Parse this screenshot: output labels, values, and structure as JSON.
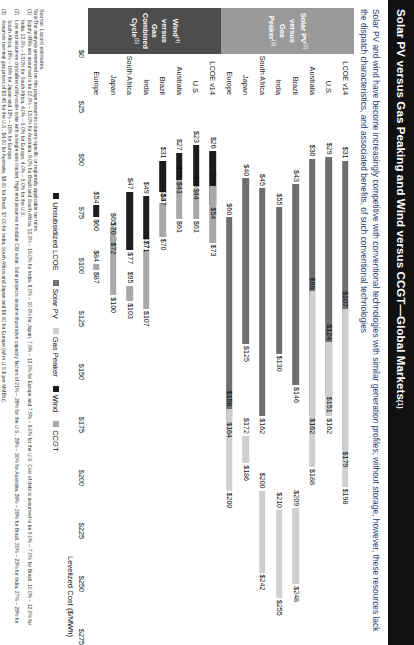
{
  "header": {
    "title": "Solar PV versus Gas Peaking and Wind versus CCGT—Global Markets",
    "title_sup": "(1)",
    "subtitle": "Solar PV and wind have become increasingly competitive with conventional technologies with similar generation profiles; without storage, however, these resources lack the dispatch characteristics, and associated benefits, of such conventional technologies"
  },
  "groups": [
    {
      "tab_label_lines": [
        "Solar PV",
        "versus",
        "Gas Peaker"
      ],
      "tab_sup_1": "(2)",
      "tab_sup_3": "(3)",
      "tab_color": "#9a9a9a",
      "rows": [
        {
          "cat": "LCOE v14",
          "lo": "$31",
          "hi": "$179",
          "lo_v": 31,
          "hi_v": 179,
          "kind": "solar",
          "peak_lo": "$107",
          "peak_hi": "$198",
          "peak_lo_v": 107,
          "peak_hi_v": 198
        },
        {
          "cat": "U.S.",
          "lo": "$29",
          "hi": "$151",
          "lo_v": 29,
          "hi_v": 151,
          "kind": "solar",
          "peak_lo": "$124",
          "peak_hi": "$162",
          "peak_lo_v": 124,
          "peak_hi_v": 162
        },
        {
          "cat": "Australia",
          "lo": "$30",
          "hi": "$162",
          "lo_v": 30,
          "hi_v": 162,
          "kind": "solar",
          "peak_lo": "$98",
          "peak_hi": "$188",
          "peak_lo_v": 98,
          "peak_hi_v": 188
        },
        {
          "cat": "Brazil",
          "lo": "$43",
          "hi": "$146",
          "lo_v": 43,
          "hi_v": 146,
          "kind": "solar",
          "peak_lo": "$209",
          "peak_hi": "$248",
          "peak_lo_v": 209,
          "peak_hi_v": 248
        },
        {
          "cat": "India",
          "lo": "$55",
          "hi": "$130",
          "lo_v": 55,
          "hi_v": 130,
          "kind": "solar",
          "peak_lo": "$210",
          "peak_hi": "$255",
          "peak_lo_v": 210,
          "peak_hi_v": 255
        },
        {
          "cat": "South Africa",
          "lo": "$45",
          "hi": "$162",
          "lo_v": 45,
          "hi_v": 162,
          "kind": "solar",
          "peak_lo": "$200",
          "peak_hi": "$242",
          "peak_lo_v": 200,
          "peak_hi_v": 242
        },
        {
          "cat": "Japan",
          "lo": "$40",
          "hi": "$125",
          "lo_v": 40,
          "hi_v": 125,
          "kind": "solar",
          "peak_lo": "$172",
          "peak_hi": "$186",
          "peak_lo_v": 172,
          "peak_hi_v": 186
        },
        {
          "cat": "Europe",
          "lo": "$60",
          "hi": "$164",
          "lo_v": 60,
          "hi_v": 164,
          "kind": "solar",
          "peak_lo": "$158",
          "peak_hi": "$200",
          "peak_lo_v": 158,
          "peak_hi_v": 200
        }
      ]
    },
    {
      "tab_label_lines": [
        "Wind",
        "versus",
        "Gas Combined",
        "Cycle"
      ],
      "tab_sup_1": "(4)",
      "tab_sup_3": "(5)",
      "tab_color": "#4d4d4d",
      "rows": [
        {
          "cat": "LCOE v14",
          "lo": "$26",
          "hi": "$54",
          "lo_v": 26,
          "hi_v": 54,
          "kind": "wind",
          "peak_lo": "$44",
          "peak_hi": "$73",
          "peak_lo_v": 44,
          "peak_hi_v": 73
        },
        {
          "cat": "U.S.",
          "lo": "$23",
          "hi": "$44",
          "lo_v": 23,
          "hi_v": 44,
          "kind": "wind",
          "peak_lo": "$46",
          "peak_hi": "$61",
          "peak_lo_v": 46,
          "peak_hi_v": 61
        },
        {
          "cat": "Australia",
          "lo": "$27",
          "hi": "$41",
          "lo_v": 27,
          "hi_v": 41,
          "kind": "wind",
          "peak_lo": "$41",
          "peak_hi": "$61",
          "peak_lo_v": 41,
          "peak_hi_v": 61
        },
        {
          "cat": "Brazil",
          "lo": "$31",
          "hi": "$47",
          "lo_v": 31,
          "hi_v": 47,
          "kind": "wind",
          "peak_lo": "$53",
          "peak_hi": "$70",
          "peak_lo_v": 53,
          "peak_hi_v": 70
        },
        {
          "cat": "India",
          "lo": "$49",
          "hi": "$71",
          "lo_v": 49,
          "hi_v": 71,
          "kind": "wind",
          "peak_lo": "$77",
          "peak_hi": "$107",
          "peak_lo_v": 77,
          "peak_hi_v": 107
        },
        {
          "cat": "South Africa",
          "lo": "$47",
          "hi": "$77",
          "lo_v": 47,
          "hi_v": 77,
          "kind": "wind",
          "peak_lo": "$95",
          "peak_hi": "$103",
          "peak_lo_v": 95,
          "peak_hi_v": 103
        },
        {
          "cat": "Japan",
          "lo": "$70",
          "hi": "$72",
          "lo_v": 70,
          "hi_v": 72,
          "kind": "wind",
          "peak_lo": "$65",
          "peak_hi": "$100",
          "peak_lo_v": 65,
          "peak_hi_v": 100
        },
        {
          "cat": "Europe",
          "lo": "$54",
          "hi": "$60",
          "lo_v": 54,
          "hi_v": 60,
          "kind": "wind",
          "peak_lo": "$84",
          "peak_hi": "$87",
          "peak_lo_v": 84,
          "peak_hi_v": 87
        }
      ]
    }
  ],
  "axis": {
    "ticks": [
      "$0",
      "$25",
      "$50",
      "$75",
      "$100",
      "$125",
      "$150",
      "$175",
      "$200",
      "$225",
      "$250",
      "$275"
    ],
    "values": [
      0,
      25,
      50,
      75,
      100,
      125,
      150,
      175,
      200,
      225,
      250,
      275
    ],
    "min": 0,
    "max": 275,
    "title": "Levelized Cost ($/MWh)"
  },
  "legend": [
    {
      "label": "Unsubsidized LCOE",
      "swatch": "sw-lcoe"
    },
    {
      "label": "Solar PV",
      "swatch": "sw-solar"
    },
    {
      "label": "Gas Peaker",
      "swatch": "sw-peaker"
    },
    {
      "label": "Wind",
      "swatch": "sw-wind"
    },
    {
      "label": "CCGT",
      "swatch": "sw-ccgt"
    }
  ],
  "footer": {
    "source": "Source:  Lazard estimates.",
    "notes_label": "Note:",
    "notes_lead": "The analysis presented on this page assumes country-specific or regionally applicable tax rates.",
    "notes": [
      {
        "n": "(1)",
        "t": "Equity IRRs are assumed to be 12.0% – 13.0% for Australia, 9.0% for Brazil and South Africa, 13.0% – 15.0% for India, 8.0% – 10.0% for Japan, 7.5% – 12.0% for Europe and 7.5% – 9.0% for the U.S. Cost of debt is assumed to be 5.0% – 7.0% for Brazil, 10.0% – 12.0% for India, 12.0% – 13.0% for South Africa, 4.0% – 5.0% for Europe, 4.0% – 5.0% for the U.S."
      },
      {
        "n": "(2)",
        "t": "Low end assumes crystalline utility-scale solar with a single-axis tracker. High end assumes modular C&I solar. Solar projects assume illustrative capacity factors of 21% – 28% for the U.S., 28% – 30% for Australia, 26% – 28% for Brazil, 20% – 23% for India, 27% – 28% for South Africa, 15% – 16% for Japan and 13% – 16% for Europe."
      },
      {
        "n": "(3)",
        "t": "Assumes nominal gas prices of $3.45 for the U.S., $4.00 for Australia, $8.00 for Brazil, $7.00 for India, South Africa and Japan and $6.00 for Europe (all in U.S.$ per MMBtu)."
      },
      {
        "n": "(4)",
        "t": "Wind projects assume illustrative capacity factors of 38% – 55% for the U.S., 40% for Australia, 45% – 55% for Brazil, 25% – 35% for India, South Africa and Japan and $6.00 for Europe."
      },
      {
        "n": "(5)",
        "t": "Assumes nominal gas prices of $3.45 for the U.S., $4.00 for Australia, $8.00 for Brazil, $7.00 for India, South Africa and Japan and $6.00 for Europe, respectively, for all geographies."
      }
    ]
  }
}
